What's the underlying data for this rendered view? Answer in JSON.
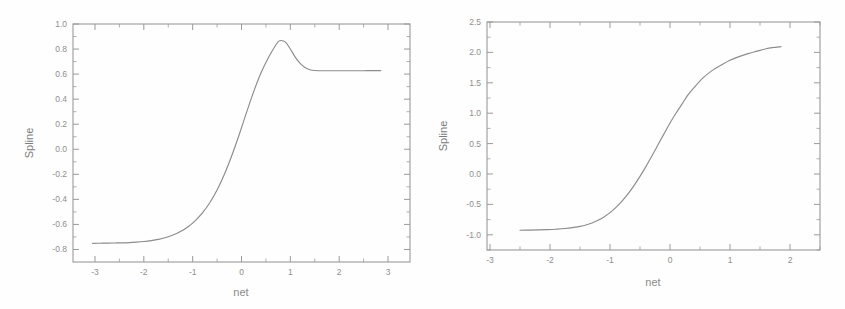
{
  "figure": {
    "background_color": "#fefefe",
    "line_color": "#8c8c8c",
    "axis_color": "#9a9a9a",
    "text_color": "#8f8f8f"
  },
  "chart_data": [
    {
      "type": "line",
      "panel": "left",
      "title": "",
      "xlabel": "net",
      "ylabel": "Spline",
      "xlim": [
        -3.45,
        3.45
      ],
      "ylim": [
        -0.9,
        1.0
      ],
      "grid": false,
      "legend": null,
      "xticks": [
        -3,
        -2,
        -1,
        0,
        1,
        2,
        3
      ],
      "xticklabels": [
        "-3",
        "-2",
        "-1",
        "0",
        "1",
        "2",
        "3"
      ],
      "yticks": [
        -0.8,
        -0.6,
        -0.4,
        -0.2,
        0.0,
        0.2,
        0.4,
        0.6,
        0.8,
        1.0
      ],
      "yticklabels": [
        "-0.8",
        "-0.6",
        "-0.4",
        "-0.2",
        "0.0",
        "0.2",
        "0.4",
        "0.6",
        "0.8",
        "1.0"
      ],
      "minor_ticks": true,
      "x": [
        -3.05,
        -2.9,
        -2.75,
        -2.6,
        -2.45,
        -2.3,
        -2.15,
        -2.0,
        -1.85,
        -1.7,
        -1.55,
        -1.4,
        -1.25,
        -1.1,
        -0.95,
        -0.8,
        -0.65,
        -0.5,
        -0.35,
        -0.2,
        -0.05,
        0.1,
        0.25,
        0.4,
        0.55,
        0.7,
        0.78,
        0.9,
        1.0,
        1.1,
        1.2,
        1.3,
        1.4,
        1.5,
        1.7,
        1.9,
        2.1,
        2.3,
        2.5,
        2.7,
        2.85
      ],
      "y": [
        -0.751,
        -0.75,
        -0.749,
        -0.748,
        -0.747,
        -0.745,
        -0.741,
        -0.736,
        -0.729,
        -0.719,
        -0.704,
        -0.684,
        -0.657,
        -0.62,
        -0.571,
        -0.508,
        -0.427,
        -0.325,
        -0.2,
        -0.052,
        0.114,
        0.29,
        0.46,
        0.61,
        0.73,
        0.83,
        0.866,
        0.855,
        0.8,
        0.735,
        0.685,
        0.653,
        0.635,
        0.629,
        0.627,
        0.627,
        0.627,
        0.627,
        0.627,
        0.628,
        0.628
      ],
      "curve_notes": {
        "left_asymptote": -0.75,
        "overshoot_peak_x": 0.78,
        "overshoot_peak_y": 0.87,
        "right_plateau": 0.63
      }
    },
    {
      "type": "line",
      "panel": "right",
      "title": "",
      "xlabel": "net",
      "ylabel": "Spline",
      "xlim": [
        -3.05,
        2.5
      ],
      "ylim": [
        -1.25,
        2.5
      ],
      "grid": false,
      "legend": null,
      "xticks": [
        -3,
        -2,
        -1,
        0,
        1,
        2
      ],
      "xticklabels": [
        "-3",
        "-2",
        "-1",
        "0",
        "1",
        "2"
      ],
      "yticks": [
        -1.0,
        -0.5,
        0.0,
        0.5,
        1.0,
        1.5,
        2.0,
        2.5
      ],
      "yticklabels": [
        "-1.0",
        "-0.5",
        "0.0",
        "0.5",
        "1.0",
        "1.5",
        "2.0",
        "2.5"
      ],
      "minor_ticks": true,
      "x": [
        -2.5,
        -2.35,
        -2.2,
        -2.05,
        -1.9,
        -1.75,
        -1.6,
        -1.5,
        -1.4,
        -1.3,
        -1.2,
        -1.1,
        -1.0,
        -0.9,
        -0.8,
        -0.7,
        -0.6,
        -0.5,
        -0.4,
        -0.3,
        -0.2,
        -0.1,
        0.0,
        0.1,
        0.2,
        0.3,
        0.4,
        0.55,
        0.7,
        0.85,
        1.0,
        1.15,
        1.3,
        1.45,
        1.6,
        1.72,
        1.85
      ],
      "y": [
        -0.925,
        -0.923,
        -0.92,
        -0.915,
        -0.908,
        -0.897,
        -0.878,
        -0.862,
        -0.838,
        -0.805,
        -0.762,
        -0.706,
        -0.636,
        -0.549,
        -0.446,
        -0.327,
        -0.19,
        -0.04,
        0.125,
        0.3,
        0.48,
        0.66,
        0.84,
        1.0,
        1.15,
        1.3,
        1.42,
        1.58,
        1.7,
        1.79,
        1.87,
        1.93,
        1.98,
        2.02,
        2.06,
        2.08,
        2.095
      ],
      "curve_notes": {
        "left_asymptote": -0.93,
        "right_plateau": 2.1,
        "inflection_x": 0.0
      }
    }
  ]
}
